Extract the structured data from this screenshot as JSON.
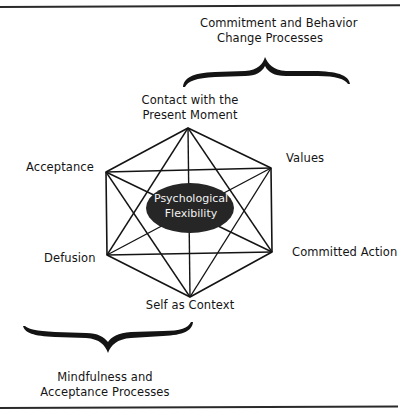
{
  "diagram": {
    "core": {
      "line1": "Psychological",
      "line2": "Flexibility",
      "fill": "#262626",
      "text_color": "#f2f2f2"
    },
    "groups": {
      "commitment": {
        "line1": "Commitment and Behavior",
        "line2": "Change Processes"
      },
      "mindfulness": {
        "line1": "Mindfulness and",
        "line2": "Acceptance Processes"
      }
    },
    "nodes": {
      "contact": {
        "line1": "Contact with the",
        "line2": "Present Moment"
      },
      "acceptance": {
        "label": "Acceptance"
      },
      "values": {
        "label": "Values"
      },
      "defusion": {
        "label": "Defusion"
      },
      "committed_action": {
        "label": "Committed Action"
      },
      "self_as_context": {
        "label": "Self as Context"
      }
    },
    "line_color": "#141414"
  }
}
